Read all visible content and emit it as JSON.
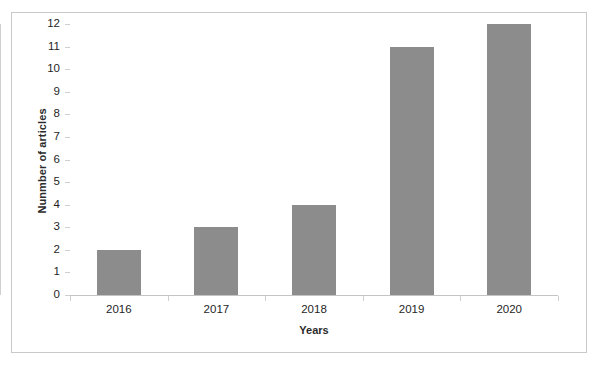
{
  "chart_data": {
    "type": "bar",
    "title": "",
    "subtitle": "",
    "categories": [
      "2016",
      "2017",
      "2018",
      "2019",
      "2020"
    ],
    "values": [
      2,
      3,
      4,
      11,
      12
    ],
    "series": [
      {
        "name": "Number of articles",
        "values": [
          2,
          3,
          4,
          11,
          12
        ]
      }
    ],
    "xlabel": "Years",
    "ylabel": "Nunmber of articles",
    "ylim": [
      0,
      12
    ],
    "ytick_labels": [
      "12",
      "11",
      "10",
      "9",
      "8",
      "7",
      "6",
      "5",
      "4",
      "3",
      "2",
      "1",
      "0"
    ],
    "ytick_values": [
      12,
      11,
      10,
      9,
      8,
      7,
      6,
      5,
      4,
      3,
      2,
      1,
      0
    ],
    "ytick_step": 1,
    "xtick_labels": [
      "2016",
      "2017",
      "2018",
      "2019",
      "2020"
    ],
    "grid": false,
    "legend": false,
    "legend_position": "none",
    "bar_color": "#8c8c8c",
    "axis_color": "#cfcfcf",
    "frame_color": "#c9c9c9",
    "text_color": "#1f1f1f",
    "background": "#ffffff"
  }
}
